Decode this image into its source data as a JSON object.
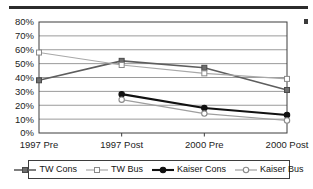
{
  "chart_data": {
    "type": "line",
    "title": "",
    "subtitle": "",
    "xlabel": "",
    "ylabel": "",
    "categories": [
      "1997 Pre",
      "1997 Post",
      "2000 Pre",
      "2000 Post"
    ],
    "ylim": [
      0,
      80
    ],
    "ytick_step": 10,
    "ytick_labels": [
      "0%",
      "10%",
      "20%",
      "30%",
      "40%",
      "50%",
      "60%",
      "70%",
      "80%"
    ],
    "ytick_values": [
      0,
      10,
      20,
      30,
      40,
      50,
      60,
      70,
      80
    ],
    "grid": "horizontal",
    "legend_position": "bottom",
    "value_suffix": "%",
    "series": [
      {
        "name": "TW Cons",
        "values": [
          38,
          52,
          47,
          31
        ],
        "marker": "filled-square",
        "color": "#6e6e6e",
        "line_color": "#5e5e5e",
        "line_width": 1.6
      },
      {
        "name": "TW Bus",
        "values": [
          58,
          49,
          43,
          39
        ],
        "marker": "open-square",
        "color": "#ffffff",
        "line_color": "#a8a8a8",
        "line_width": 1.2
      },
      {
        "name": "Kaiser Cons",
        "values": [
          null,
          28,
          18,
          13
        ],
        "marker": "filled-circle",
        "color": "#111111",
        "line_color": "#111111",
        "line_width": 2.1
      },
      {
        "name": "Kaiser Bus",
        "values": [
          null,
          24,
          14,
          9
        ],
        "marker": "open-circle",
        "color": "#ffffff",
        "line_color": "#9e9e9e",
        "line_width": 1.2
      }
    ]
  },
  "legend": {
    "items": [
      {
        "label": "TW Cons"
      },
      {
        "label": "TW Bus"
      },
      {
        "label": "Kaiser Cons"
      },
      {
        "label": "Kaiser Bus"
      }
    ]
  },
  "decor": {
    "top_rule_name": "top-divider-rule",
    "margin_mark_name": "margin-artifact"
  }
}
